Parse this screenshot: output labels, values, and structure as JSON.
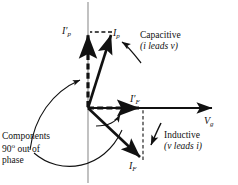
{
  "figure": {
    "type": "phasor-diagram",
    "background": "#ffffff",
    "ink": "#111111",
    "axis_color": "#8c8c8c"
  },
  "axes": {
    "horizontal": {
      "label": "V",
      "subscript": "g",
      "origin": [
        88,
        108
      ],
      "tip": [
        216,
        108
      ],
      "style": "solid-arrow"
    },
    "vertical": {
      "label": "",
      "top": [
        88,
        2
      ],
      "bottom": [
        88,
        183
      ],
      "style": "thin-line"
    }
  },
  "vectors": [
    {
      "name": "I_p",
      "label": "I",
      "subscript": "p",
      "prime": false,
      "from": [
        88,
        108
      ],
      "to": [
        112,
        32
      ],
      "style": "solid-arrow",
      "meaning": "photocurrent phasor, leads Vg (capacitive)"
    },
    {
      "name": "I_p_prime",
      "label": "I",
      "subscript": "p",
      "prime": true,
      "from": [
        88,
        108
      ],
      "to": [
        88,
        31
      ],
      "style": "dashed-arrow",
      "meaning": "quadrature component of I_p, 90 degrees out of phase"
    },
    {
      "name": "I_F_prime",
      "label": "I",
      "subscript": "F",
      "prime": true,
      "from": [
        88,
        108
      ],
      "to": [
        143,
        108
      ],
      "style": "dashed-arrow",
      "meaning": "in-phase component along Vg"
    },
    {
      "name": "I_F",
      "label": "I",
      "subscript": "F",
      "prime": false,
      "from": [
        88,
        108
      ],
      "to": [
        143,
        161
      ],
      "style": "solid-arrow",
      "meaning": "field current phasor, lags Vg (inductive)"
    }
  ],
  "connectors": [
    {
      "name": "ip-tip-to-axis",
      "from": [
        112,
        32
      ],
      "to": [
        89,
        32
      ],
      "style": "dashed"
    },
    {
      "name": "if-tip-to-axis",
      "from": [
        143,
        161
      ],
      "to": [
        143,
        109
      ],
      "style": "dashed"
    }
  ],
  "angle_arcs": [
    {
      "name": "quadrature-arc-upper",
      "note": "arc from Components leader up to I_p_prime"
    },
    {
      "name": "quadrature-arc-lower",
      "note": "arc between I_F_prime and I_F"
    }
  ],
  "annotations": {
    "capacitive": {
      "line1": "Capacitive",
      "line2": "(i leads v)",
      "leader": "curved-arrow-pointing-up-left-to-Ip"
    },
    "inductive": {
      "line1": "Inductive",
      "line2": "(v leads i)",
      "leader": "short-arrow-pointing-down-left-to-IF"
    },
    "components": {
      "line1": "Components",
      "line2_pre": "90",
      "line2_deg": "o",
      "line2_post": " out of",
      "line3": "phase",
      "leader": "two-curved-arrows-to-quadrature-components"
    }
  }
}
